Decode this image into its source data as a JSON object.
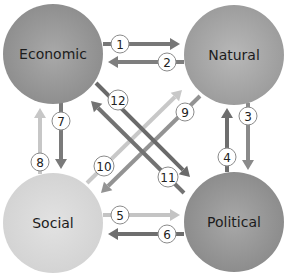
{
  "diagram": {
    "type": "relationship-cycle",
    "nodes": [
      {
        "id": "economic",
        "label": "Economic",
        "cx": 53,
        "cy": 54,
        "r": 50,
        "fill": "#8c8c8c",
        "highlight": "#a9a9a9"
      },
      {
        "id": "natural",
        "label": "Natural",
        "cx": 234,
        "cy": 55,
        "r": 50,
        "fill": "#9a9a9a",
        "highlight": "#b8b8b8"
      },
      {
        "id": "social",
        "label": "Social",
        "cx": 53,
        "cy": 223,
        "r": 50,
        "fill": "#d2d2d2",
        "highlight": "#e2e2e2"
      },
      {
        "id": "political",
        "label": "Political",
        "cx": 234,
        "cy": 222,
        "r": 50,
        "fill": "#8a8a8a",
        "highlight": "#a8a8a8"
      }
    ],
    "arrows": [
      {
        "num": "1",
        "from": "economic",
        "to": "natural",
        "x1": 103,
        "y1": 44,
        "x2": 180,
        "y2": 44,
        "color": "#777777",
        "lx": 120,
        "ly": 44
      },
      {
        "num": "2",
        "from": "natural",
        "to": "economic",
        "x1": 184,
        "y1": 62,
        "x2": 108,
        "y2": 62,
        "color": "#7e7e7e",
        "lx": 167,
        "ly": 62
      },
      {
        "num": "3",
        "from": "natural",
        "to": "political",
        "x1": 248,
        "y1": 103,
        "x2": 248,
        "y2": 170,
        "color": "#8a8a8a",
        "lx": 248,
        "ly": 116
      },
      {
        "num": "4",
        "from": "political",
        "to": "natural",
        "x1": 227,
        "y1": 172,
        "x2": 227,
        "y2": 108,
        "color": "#6e6e6e",
        "lx": 227,
        "ly": 157
      },
      {
        "num": "5",
        "from": "social",
        "to": "political",
        "x1": 103,
        "y1": 215,
        "x2": 180,
        "y2": 215,
        "color": "#c4c4c4",
        "lx": 120,
        "ly": 215
      },
      {
        "num": "6",
        "from": "political",
        "to": "social",
        "x1": 184,
        "y1": 234,
        "x2": 108,
        "y2": 234,
        "color": "#6e6e6e",
        "lx": 167,
        "ly": 234
      },
      {
        "num": "7",
        "from": "economic",
        "to": "social",
        "x1": 61,
        "y1": 103,
        "x2": 61,
        "y2": 169,
        "color": "#7a7a7a",
        "lx": 61,
        "ly": 121
      },
      {
        "num": "8",
        "from": "social",
        "to": "economic",
        "x1": 40,
        "y1": 174,
        "x2": 40,
        "y2": 108,
        "color": "#c7c7c7",
        "lx": 40,
        "ly": 162
      },
      {
        "num": "9",
        "from": "natural",
        "to": "social",
        "x1": 200,
        "y1": 96,
        "x2": 101,
        "y2": 193,
        "color": "#939393",
        "lx": 185,
        "ly": 112
      },
      {
        "num": "10",
        "from": "social",
        "to": "natural",
        "x1": 87,
        "y1": 183,
        "x2": 182,
        "y2": 90,
        "color": "#c8c8c8",
        "lx": 104,
        "ly": 166
      },
      {
        "num": "11",
        "from": "political",
        "to": "economic",
        "x1": 184,
        "y1": 193,
        "x2": 91,
        "y2": 101,
        "color": "#737373",
        "lx": 168,
        "ly": 177
      },
      {
        "num": "12",
        "from": "economic",
        "to": "political",
        "x1": 96,
        "y1": 83,
        "x2": 190,
        "y2": 177,
        "color": "#6a6a6a",
        "lx": 118,
        "ly": 100
      }
    ]
  }
}
